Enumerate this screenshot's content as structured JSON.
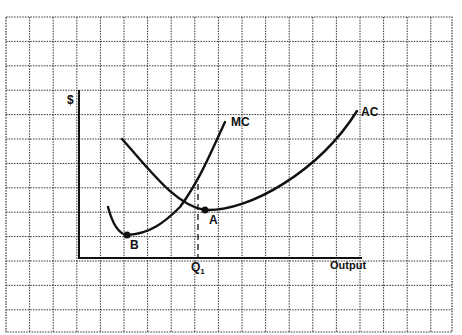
{
  "diagram": {
    "type": "cost-curves",
    "y_axis_label": "$",
    "x_axis_label": "Output",
    "curves": [
      {
        "id": "mc",
        "label": "MC",
        "description": "Marginal cost curve, U-shaped, minimum at point B"
      },
      {
        "id": "ac",
        "label": "AC",
        "description": "Average cost curve, U-shaped, minimum at point A where MC intersects AC"
      }
    ],
    "points": [
      {
        "id": "A",
        "label": "A",
        "description": "Minimum of AC"
      },
      {
        "id": "B",
        "label": "B",
        "description": "Minimum of MC"
      }
    ],
    "quantity_marker": {
      "label": "Q",
      "subscript": "1",
      "description": "Output level at point A"
    },
    "background": "graph paper grid",
    "colors": {
      "ink": "#111111",
      "grid": "#333333",
      "paper": "#ffffff"
    }
  }
}
